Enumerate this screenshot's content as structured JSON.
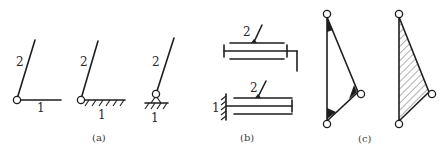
{
  "figure": {
    "panels": [
      {
        "caption": "(a)",
        "subfigures": [
          {
            "link_moving": "2",
            "link_fixed": "1",
            "type": "revolute-pair-link"
          },
          {
            "link_moving": "2",
            "link_fixed": "1",
            "type": "revolute-pair-ground"
          },
          {
            "link_moving": "2",
            "link_fixed": "1",
            "type": "revolute-pair-support"
          }
        ]
      },
      {
        "caption": "(b)",
        "subfigures": [
          {
            "link_moving": "2",
            "type": "prismatic-pair-bar"
          },
          {
            "link_moving": "2",
            "link_fixed": "1",
            "type": "prismatic-pair-ground"
          }
        ]
      },
      {
        "caption": "(c)",
        "subfigures": [
          {
            "type": "ternary-link-welded-corners"
          },
          {
            "type": "ternary-link-hatched"
          }
        ]
      }
    ]
  },
  "labels": {
    "a1_link2": "2",
    "a1_link1": "1",
    "a2_link2": "2",
    "a2_link1": "1",
    "a3_link2": "2",
    "a3_link1": "1",
    "b1_link2": "2",
    "b2_link2": "2",
    "b2_link1": "1",
    "cap_a": "(a)",
    "cap_b": "(b)",
    "cap_c": "(c)"
  }
}
